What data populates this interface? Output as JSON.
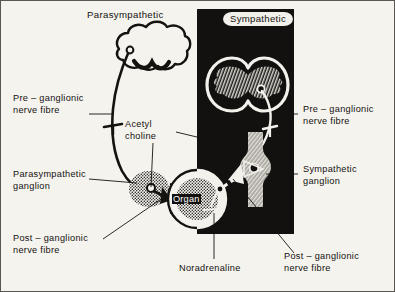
{
  "figure": {
    "kind": "autonomic-nervous-system-diagram",
    "paper_color": "#f5f3ee",
    "ink_color": "#13110f",
    "panel_color": "#121110",
    "ganglion_fill": "#9d9a93"
  },
  "titles": {
    "parasympathetic": "Parasympathetic",
    "sympathetic": "Sympathetic"
  },
  "center": {
    "organ": "Organ"
  },
  "labels": {
    "left_pre_ganglionic": "Pre – ganglionic\nnerve fibre",
    "acetyl_choline": "Acetyl\ncholine",
    "parasympathetic_ganglion": "Parasympathetic\nganglion",
    "left_post_ganglionic": "Post – ganglionic\nnerve fibre",
    "right_pre_ganglionic": "Pre – ganglionic\nnerve fibre",
    "sympathetic_ganglion": "Sympathetic\nganglion",
    "right_post_ganglionic": "Post – ganglionic\nnerve fibre",
    "noradrenaline": "Noradrenaline"
  }
}
